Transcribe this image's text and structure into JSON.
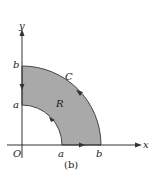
{
  "figure": {
    "caption": "(b)",
    "labels": {
      "x_axis": "x",
      "y_axis": "y",
      "origin": "O",
      "x_inner": "a",
      "x_outer": "b",
      "y_inner": "a",
      "y_outer": "b",
      "region": "R",
      "curve": "C"
    },
    "colors": {
      "region_fill": "#a9a9a9",
      "stroke": "#333333"
    },
    "geometry": {
      "inner_radius": "a",
      "outer_radius": "b",
      "quadrant": "first"
    }
  }
}
